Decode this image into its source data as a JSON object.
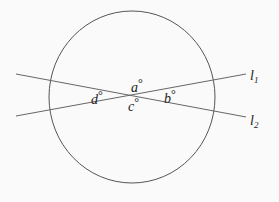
{
  "diagram": {
    "circle": {
      "cx": 132,
      "cy": 97,
      "rx": 83,
      "ry": 86,
      "stroke": "#555555"
    },
    "lines": [
      {
        "name": "l1",
        "x1": 16,
        "y1": 116,
        "x2": 246,
        "y2": 74,
        "label": "l",
        "subscript": "1"
      },
      {
        "name": "l2",
        "x1": 16,
        "y1": 74,
        "x2": 246,
        "y2": 117,
        "label": "l",
        "subscript": "2"
      }
    ],
    "angles": [
      {
        "name": "a",
        "label": "a",
        "unit": "°",
        "x": 131,
        "y": 92
      },
      {
        "name": "b",
        "label": "b",
        "unit": "°",
        "x": 164,
        "y": 103
      },
      {
        "name": "c",
        "label": "c",
        "unit": "°",
        "x": 128,
        "y": 111
      },
      {
        "name": "d",
        "label": "d",
        "unit": "°",
        "x": 91,
        "y": 104
      }
    ],
    "line_color": "#666666"
  }
}
